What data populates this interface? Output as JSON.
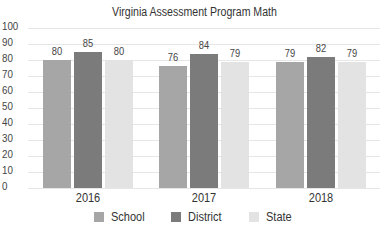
{
  "chart_data": {
    "type": "bar",
    "title": "Virginia Assessment Program Math",
    "categories": [
      "2016",
      "2017",
      "2018"
    ],
    "series": [
      {
        "name": "School",
        "values": [
          80,
          76,
          79
        ],
        "color": "#a6a6a6"
      },
      {
        "name": "District",
        "values": [
          85,
          84,
          82
        ],
        "color": "#7b7b7b"
      },
      {
        "name": "State",
        "values": [
          80,
          79,
          79
        ],
        "color": "#e3e3e3"
      }
    ],
    "xlabel": "",
    "ylabel": "",
    "ylim": [
      0,
      100
    ],
    "yticks": [
      0,
      10,
      20,
      30,
      40,
      50,
      60,
      70,
      80,
      90,
      100
    ],
    "grid": true,
    "legend_position": "bottom",
    "data_labels": true
  },
  "labels": {
    "title": "Virginia Assessment Program Math",
    "yticks": [
      "100",
      "90",
      "80",
      "70",
      "60",
      "50",
      "40",
      "30",
      "20",
      "10",
      "0"
    ],
    "categories": [
      "2016",
      "2017",
      "2018"
    ],
    "values": {
      "g0": [
        "80",
        "85",
        "80"
      ],
      "g1": [
        "76",
        "84",
        "79"
      ],
      "g2": [
        "79",
        "82",
        "79"
      ]
    },
    "legend": [
      "School",
      "District",
      "State"
    ]
  }
}
